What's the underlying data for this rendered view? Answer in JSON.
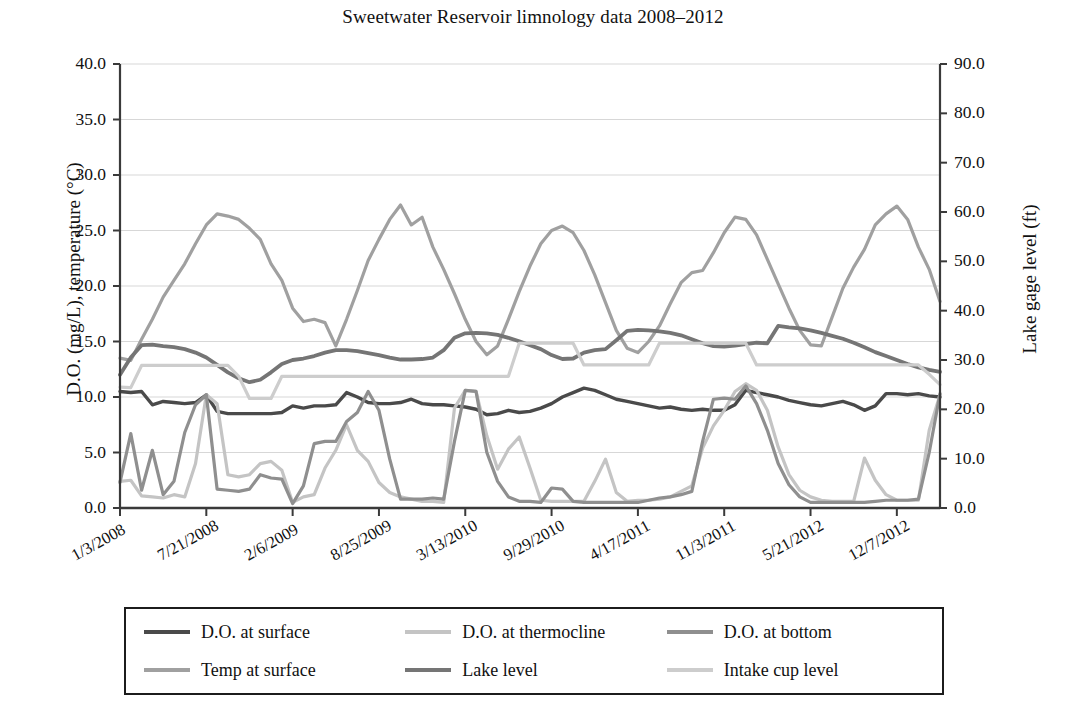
{
  "chart": {
    "title": "Sweetwater Reservoir limnology data 2008–2012",
    "y_left_label": "D.O. (mg/L), temperature (°C)",
    "y_right_label": "Lake gage level (ft)"
  },
  "chart_data": {
    "type": "line",
    "title": "Sweetwater Reservoir limnology data 2008–2012",
    "xlabel": "",
    "ylabel": "D.O. (mg/L), temperature (°C)",
    "y2label": "Lake gage level (ft)",
    "ylim": [
      0,
      40
    ],
    "y2lim": [
      0,
      90
    ],
    "yticks": [
      "0.0",
      "5.0",
      "10.0",
      "15.0",
      "20.0",
      "25.0",
      "30.0",
      "35.0",
      "40.0"
    ],
    "y2ticks": [
      "0.0",
      "10.0",
      "20.0",
      "30.0",
      "40.0",
      "50.0",
      "60.0",
      "70.0",
      "80.0",
      "90.0"
    ],
    "grid": true,
    "legend_position": "below-plot",
    "xtick_labels": [
      "1/3/2008",
      "7/21/2008",
      "2/6/2009",
      "8/25/2009",
      "3/13/2010",
      "9/29/2010",
      "4/17/2011",
      "11/3/2011",
      "5/21/2012",
      "12/7/2012"
    ],
    "xtick_positions": [
      0,
      8,
      16,
      24,
      32,
      40,
      48,
      56,
      64,
      72
    ],
    "n_points": 77,
    "series": [
      {
        "name": "D.O. at surface",
        "axis": "left",
        "color": "#4a4a4a",
        "width": 3.4,
        "values": [
          10.5,
          10.4,
          10.5,
          9.3,
          9.6,
          9.5,
          9.4,
          9.5,
          10.2,
          8.7,
          8.5,
          8.5,
          8.5,
          8.5,
          8.5,
          8.6,
          9.2,
          9.0,
          9.2,
          9.2,
          9.3,
          10.4,
          10.0,
          9.5,
          9.4,
          9.4,
          9.5,
          9.8,
          9.4,
          9.3,
          9.3,
          9.2,
          9.1,
          8.9,
          8.4,
          8.5,
          8.8,
          8.6,
          8.7,
          9.0,
          9.4,
          10.0,
          10.4,
          10.8,
          10.6,
          10.2,
          9.8,
          9.6,
          9.4,
          9.2,
          9.0,
          9.1,
          8.9,
          8.8,
          8.9,
          8.8,
          8.8,
          9.3,
          10.6,
          10.4,
          10.2,
          10.0,
          9.7,
          9.5,
          9.3,
          9.2,
          9.4,
          9.6,
          9.3,
          8.8,
          9.2,
          10.3,
          10.3,
          10.2,
          10.3,
          10.1,
          10.0
        ]
      },
      {
        "name": "D.O. at thermocline",
        "axis": "left",
        "color": "#c4c4c4",
        "width": 3.2,
        "values": [
          2.4,
          2.5,
          1.1,
          1.0,
          0.9,
          1.2,
          1.0,
          4.0,
          10.2,
          9.4,
          3.0,
          2.8,
          3.0,
          4.0,
          4.2,
          3.4,
          0.5,
          1.0,
          1.2,
          3.6,
          5.2,
          7.5,
          5.2,
          4.2,
          2.3,
          1.4,
          1.0,
          0.8,
          0.6,
          0.6,
          0.5,
          9.0,
          10.6,
          10.5,
          6.5,
          3.5,
          5.3,
          6.4,
          3.6,
          0.7,
          0.6,
          0.6,
          0.6,
          0.6,
          2.4,
          4.4,
          1.4,
          0.6,
          0.7,
          0.7,
          0.8,
          1.0,
          1.5,
          2.0,
          5.4,
          7.4,
          8.8,
          10.5,
          11.2,
          10.6,
          8.8,
          5.5,
          3.0,
          1.6,
          1.0,
          0.7,
          0.6,
          0.6,
          0.6,
          4.5,
          2.5,
          1.2,
          0.7,
          0.7,
          0.7,
          7.0,
          10.2
        ]
      },
      {
        "name": "D.O. at bottom",
        "axis": "left",
        "color": "#8f8f8f",
        "width": 3.2,
        "values": [
          2.3,
          6.7,
          1.6,
          5.2,
          1.2,
          2.4,
          6.8,
          9.3,
          10.2,
          1.7,
          1.6,
          1.5,
          1.7,
          3.0,
          2.7,
          2.6,
          0.4,
          2.0,
          5.8,
          6.0,
          6.0,
          7.8,
          8.6,
          10.5,
          8.8,
          4.4,
          0.8,
          0.8,
          0.8,
          0.9,
          0.8,
          6.0,
          10.6,
          10.5,
          5.0,
          2.4,
          1.0,
          0.6,
          0.6,
          0.5,
          1.8,
          1.7,
          0.6,
          0.5,
          0.5,
          0.5,
          0.5,
          0.5,
          0.5,
          0.7,
          0.9,
          1.0,
          1.2,
          1.5,
          6.0,
          9.8,
          9.9,
          9.8,
          11.0,
          9.4,
          7.0,
          4.0,
          2.1,
          1.0,
          0.5,
          0.5,
          0.5,
          0.5,
          0.5,
          0.5,
          0.6,
          0.7,
          0.7,
          0.7,
          0.8,
          5.0,
          10.3
        ]
      },
      {
        "name": "Temp at surface",
        "axis": "left",
        "color": "#a0a0a0",
        "width": 3.2,
        "values": [
          13.5,
          13.3,
          15.2,
          17.0,
          19.0,
          20.5,
          22.0,
          23.8,
          25.5,
          26.5,
          26.3,
          26.0,
          25.2,
          24.2,
          22.0,
          20.5,
          18.0,
          16.8,
          17.0,
          16.7,
          14.6,
          17.0,
          19.6,
          22.3,
          24.2,
          26.0,
          27.3,
          25.5,
          26.2,
          23.5,
          21.5,
          19.3,
          17.0,
          15.0,
          13.8,
          14.6,
          17.0,
          19.5,
          21.8,
          23.8,
          25.0,
          25.4,
          24.8,
          23.2,
          21.0,
          18.5,
          16.0,
          14.4,
          14.0,
          15.0,
          16.4,
          18.4,
          20.3,
          21.2,
          21.4,
          23.0,
          24.8,
          26.2,
          26.0,
          24.6,
          22.4,
          20.2,
          18.0,
          16.0,
          14.7,
          14.6,
          17.2,
          19.8,
          21.7,
          23.3,
          25.5,
          26.5,
          27.2,
          26.0,
          23.5,
          21.5,
          18.6
        ]
      },
      {
        "name": "Lake level",
        "axis": "right",
        "color": "#757575",
        "width": 3.8,
        "values": [
          27.0,
          30.5,
          33.0,
          33.1,
          32.8,
          32.6,
          32.2,
          31.5,
          30.5,
          29.0,
          27.5,
          26.3,
          25.5,
          26.0,
          27.5,
          29.2,
          30.0,
          30.3,
          30.8,
          31.5,
          32.0,
          32.0,
          31.8,
          31.4,
          31.0,
          30.5,
          30.1,
          30.1,
          30.2,
          30.5,
          32.0,
          34.5,
          35.4,
          35.5,
          35.4,
          35.1,
          34.5,
          33.8,
          33.0,
          32.2,
          31.0,
          30.2,
          30.3,
          31.5,
          32.0,
          32.2,
          34.0,
          35.9,
          36.1,
          36.0,
          35.8,
          35.5,
          35.0,
          34.2,
          33.4,
          32.8,
          32.7,
          32.9,
          33.2,
          33.5,
          33.4,
          36.9,
          36.6,
          36.4,
          36.0,
          35.5,
          34.9,
          34.3,
          33.5,
          32.6,
          31.6,
          30.8,
          30.0,
          29.2,
          28.5,
          28.0,
          27.6
        ]
      },
      {
        "name": "Intake cup level",
        "axis": "right",
        "color": "#cdcdcd",
        "width": 3.2,
        "values": [
          24.5,
          24.4,
          28.9,
          28.9,
          28.9,
          28.9,
          28.9,
          28.9,
          28.9,
          28.9,
          28.9,
          26.7,
          22.2,
          22.2,
          22.2,
          26.7,
          26.7,
          26.7,
          26.7,
          26.7,
          26.7,
          26.7,
          26.7,
          26.7,
          26.7,
          26.7,
          26.7,
          26.7,
          26.7,
          26.7,
          26.7,
          26.7,
          26.7,
          26.7,
          26.7,
          26.7,
          26.7,
          33.4,
          33.4,
          33.4,
          33.4,
          33.4,
          33.4,
          29.0,
          29.0,
          29.0,
          29.0,
          29.0,
          29.0,
          29.0,
          33.4,
          33.4,
          33.4,
          33.4,
          33.4,
          33.4,
          33.4,
          33.4,
          33.4,
          29.0,
          29.0,
          29.0,
          29.0,
          29.0,
          29.0,
          29.0,
          29.0,
          29.0,
          29.0,
          29.0,
          29.0,
          29.0,
          29.0,
          29.0,
          29.0,
          27.1,
          25.0
        ]
      }
    ]
  },
  "legend": {
    "items": [
      {
        "label": "D.O. at surface",
        "color": "#4a4a4a"
      },
      {
        "label": "D.O. at thermocline",
        "color": "#c4c4c4"
      },
      {
        "label": "D.O. at bottom",
        "color": "#8f8f8f"
      },
      {
        "label": "Temp at surface",
        "color": "#a0a0a0"
      },
      {
        "label": "Lake level",
        "color": "#757575"
      },
      {
        "label": "Intake cup level",
        "color": "#cdcdcd"
      }
    ]
  }
}
